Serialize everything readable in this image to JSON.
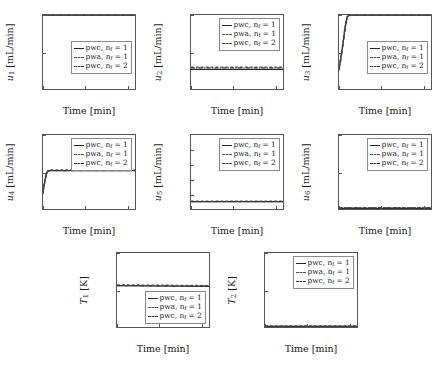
{
  "figure": {
    "background": "#ffffff",
    "axis_color": "#555555",
    "series_colors": [
      "#262626",
      "#555555",
      "#3d3d3d"
    ]
  },
  "legend": {
    "entries": [
      {
        "label": "pwc, nf = 1",
        "style": "solid"
      },
      {
        "label": "pwa, nf = 1",
        "style": "dash"
      },
      {
        "label": "pwc, nf = 2",
        "style": "dashdot"
      }
    ],
    "text_0": "pwc, n",
    "text_1": "pwa, n",
    "text_2": "pwc, n",
    "sub": "f",
    "eq_1": "= 1",
    "eq_2": "= 2"
  },
  "common": {
    "xlabel": "Time [min]",
    "xticks": [
      "0",
      "100",
      "200"
    ],
    "xlim": [
      0,
      220
    ],
    "unit_flow": "[mL/min]",
    "unit_temp": "[K]"
  },
  "chart_data": [
    {
      "type": "line",
      "id": "u1",
      "title": "",
      "xlabel": "Time [min]",
      "ylabel": "u1 [mL/min]",
      "ylabel_sym": "u",
      "ylabel_sub": "1",
      "ylabel_unit": "[mL/min]",
      "xlim": [
        0,
        220
      ],
      "ylim": [
        0,
        0.1
      ],
      "xticks": [
        0,
        100,
        200
      ],
      "yticks": [
        0,
        0.05,
        0.1
      ],
      "ytick_labels": [
        "0",
        "0.05",
        "0.1"
      ],
      "grid": false,
      "legend_position": "center-right",
      "series": [
        {
          "name": "pwc, nf = 1",
          "style": "solid",
          "x": [
            0,
            220
          ],
          "values": [
            0.1,
            0.1
          ]
        },
        {
          "name": "pwa, nf = 1",
          "style": "dash",
          "x": [
            0,
            220
          ],
          "values": [
            0.1,
            0.1
          ]
        },
        {
          "name": "pwc, nf = 2",
          "style": "dashdot",
          "x": [
            0,
            220
          ],
          "values": [
            0.1,
            0.1
          ]
        }
      ]
    },
    {
      "type": "line",
      "id": "u2",
      "xlabel": "Time [min]",
      "ylabel": "u2 [mL/min]",
      "ylabel_sym": "u",
      "ylabel_sub": "2",
      "ylabel_unit": "[mL/min]",
      "xlim": [
        0,
        220
      ],
      "ylim": [
        0,
        0.1
      ],
      "xticks": [
        0,
        100,
        200
      ],
      "yticks": [
        0,
        0.05,
        0.1
      ],
      "ytick_labels": [
        "0",
        "0.05",
        "0.1"
      ],
      "grid": false,
      "legend_position": "top-right",
      "series": [
        {
          "name": "pwc, nf = 1",
          "style": "solid",
          "x": [
            0,
            220
          ],
          "values": [
            0.0265,
            0.0265
          ]
        },
        {
          "name": "pwa, nf = 1",
          "style": "dash",
          "x": [
            0,
            220
          ],
          "values": [
            0.0295,
            0.0295
          ]
        },
        {
          "name": "pwc, nf = 2",
          "style": "dashdot",
          "x": [
            0,
            220
          ],
          "values": [
            0.0285,
            0.0285
          ]
        }
      ]
    },
    {
      "type": "line",
      "id": "u3",
      "xlabel": "Time [min]",
      "ylabel": "u3 [mL/min]",
      "ylabel_sym": "u",
      "ylabel_sub": "3",
      "ylabel_unit": "[mL/min]",
      "xlim": [
        0,
        220
      ],
      "ylim": [
        0,
        0.1
      ],
      "xticks": [
        0,
        100,
        200
      ],
      "yticks": [
        0,
        0.05,
        0.1
      ],
      "ytick_labels": [
        "0",
        "0.05",
        "0.1"
      ],
      "grid": false,
      "legend_position": "center-right",
      "series": [
        {
          "name": "pwc, nf = 1",
          "style": "solid",
          "x": [
            0,
            4,
            8,
            12,
            16,
            20,
            24,
            220
          ],
          "values": [
            0.027,
            0.04,
            0.055,
            0.072,
            0.088,
            0.098,
            0.1,
            0.1
          ]
        },
        {
          "name": "pwa, nf = 1",
          "style": "dash",
          "x": [
            0,
            4,
            8,
            12,
            16,
            20,
            24,
            220
          ],
          "values": [
            0.03,
            0.043,
            0.058,
            0.075,
            0.09,
            0.099,
            0.1,
            0.1
          ]
        },
        {
          "name": "pwc, nf = 2",
          "style": "dashdot",
          "x": [
            0,
            4,
            8,
            12,
            16,
            20,
            24,
            220
          ],
          "values": [
            0.025,
            0.038,
            0.053,
            0.07,
            0.086,
            0.097,
            0.1,
            0.1
          ]
        }
      ]
    },
    {
      "type": "line",
      "id": "u4",
      "xlabel": "Time [min]",
      "ylabel": "u4 [mL/min]",
      "ylabel_sym": "u",
      "ylabel_sub": "4",
      "ylabel_unit": "[mL/min]",
      "xlim": [
        0,
        220
      ],
      "ylim": [
        0,
        0.1
      ],
      "xticks": [
        0,
        100,
        200
      ],
      "yticks": [
        0,
        0.05,
        0.1
      ],
      "ytick_labels": [
        "0",
        "0.05",
        "0.1"
      ],
      "grid": false,
      "legend_position": "top-right",
      "series": [
        {
          "name": "pwc, nf = 1",
          "style": "solid",
          "x": [
            0,
            2,
            6,
            10,
            14,
            220
          ],
          "values": [
            0.021,
            0.03,
            0.042,
            0.05,
            0.052,
            0.052
          ]
        },
        {
          "name": "pwa, nf = 1",
          "style": "dash",
          "x": [
            0,
            2,
            6,
            10,
            14,
            220
          ],
          "values": [
            0.024,
            0.033,
            0.045,
            0.051,
            0.053,
            0.053
          ]
        },
        {
          "name": "pwc, nf = 2",
          "style": "dashdot",
          "x": [
            0,
            2,
            6,
            10,
            14,
            220
          ],
          "values": [
            0.02,
            0.029,
            0.041,
            0.05,
            0.052,
            0.052
          ]
        }
      ]
    },
    {
      "type": "line",
      "id": "u5",
      "xlabel": "Time [min]",
      "ylabel": "u5 [mL/min]",
      "ylabel_sym": "u",
      "ylabel_sub": "5",
      "ylabel_unit": "[mL/min]",
      "xlim": [
        0,
        220
      ],
      "ylim": [
        0,
        1.0
      ],
      "xticks": [
        0,
        100,
        200
      ],
      "yticks": [
        0.2,
        0.4,
        0.6,
        0.8
      ],
      "ytick_labels": [
        "0.2",
        "0.4",
        "0.6",
        "0.8"
      ],
      "grid": false,
      "legend_position": "top-right",
      "series": [
        {
          "name": "pwc, nf = 1",
          "style": "solid",
          "x": [
            0,
            220
          ],
          "values": [
            0.1,
            0.1
          ]
        },
        {
          "name": "pwa, nf = 1",
          "style": "dash",
          "x": [
            0,
            220
          ],
          "values": [
            0.105,
            0.105
          ]
        },
        {
          "name": "pwc, nf = 2",
          "style": "dashdot",
          "x": [
            0,
            220
          ],
          "values": [
            0.1,
            0.1
          ]
        }
      ]
    },
    {
      "type": "line",
      "id": "u6",
      "xlabel": "Time [min]",
      "ylabel": "u6 [mL/min]",
      "ylabel_sym": "u",
      "ylabel_sub": "6",
      "ylabel_unit": "[mL/min]",
      "xlim": [
        0,
        220
      ],
      "ylim": [
        0,
        0.2
      ],
      "xticks": [
        0,
        100,
        200
      ],
      "yticks": [
        0,
        0.1,
        0.2
      ],
      "ytick_labels": [
        "0",
        "0.1",
        "0.2"
      ],
      "grid": false,
      "legend_position": "top-right",
      "series": [
        {
          "name": "pwc, nf = 1",
          "style": "solid",
          "x": [
            0,
            220
          ],
          "values": [
            0.002,
            0.002
          ]
        },
        {
          "name": "pwa, nf = 1",
          "style": "dash",
          "x": [
            0,
            220
          ],
          "values": [
            0.004,
            0.004
          ]
        },
        {
          "name": "pwc, nf = 2",
          "style": "dashdot",
          "x": [
            0,
            220
          ],
          "values": [
            0.003,
            0.003
          ]
        }
      ]
    },
    {
      "type": "line",
      "id": "T1",
      "xlabel": "Time [min]",
      "ylabel": "T1 [K]",
      "ylabel_sym": "T",
      "ylabel_sub": "1",
      "ylabel_unit": "[K]",
      "xlim": [
        0,
        220
      ],
      "ylim": [
        300,
        400
      ],
      "xticks": [
        0,
        100,
        200
      ],
      "yticks": [
        300,
        350,
        400
      ],
      "ytick_labels": [
        "300",
        "350",
        "400"
      ],
      "grid": false,
      "legend_position": "bottom-right",
      "series": [
        {
          "name": "pwc, nf = 1",
          "style": "solid",
          "x": [
            0,
            220
          ],
          "values": [
            356,
            355
          ]
        },
        {
          "name": "pwa, nf = 1",
          "style": "dash",
          "x": [
            0,
            220
          ],
          "values": [
            357,
            356
          ]
        },
        {
          "name": "pwc, nf = 2",
          "style": "dashdot",
          "x": [
            0,
            220
          ],
          "values": [
            356,
            355
          ]
        }
      ]
    },
    {
      "type": "line",
      "id": "T2",
      "xlabel": "Time [min]",
      "ylabel": "T2 [K]",
      "ylabel_sym": "T",
      "ylabel_sub": "2",
      "ylabel_unit": "[K]",
      "xlim": [
        0,
        220
      ],
      "ylim": [
        300,
        400
      ],
      "xticks": [
        0,
        100,
        200
      ],
      "yticks": [
        300,
        350,
        400
      ],
      "ytick_labels": [
        "300",
        "350",
        "400"
      ],
      "grid": false,
      "legend_position": "top-right",
      "series": [
        {
          "name": "pwc, nf = 1",
          "style": "solid",
          "x": [
            0,
            220
          ],
          "values": [
            301,
            301
          ]
        },
        {
          "name": "pwa, nf = 1",
          "style": "dash",
          "x": [
            0,
            220
          ],
          "values": [
            301.5,
            301.5
          ]
        },
        {
          "name": "pwc, nf = 2",
          "style": "dashdot",
          "x": [
            0,
            220
          ],
          "values": [
            301,
            301
          ]
        }
      ]
    }
  ]
}
